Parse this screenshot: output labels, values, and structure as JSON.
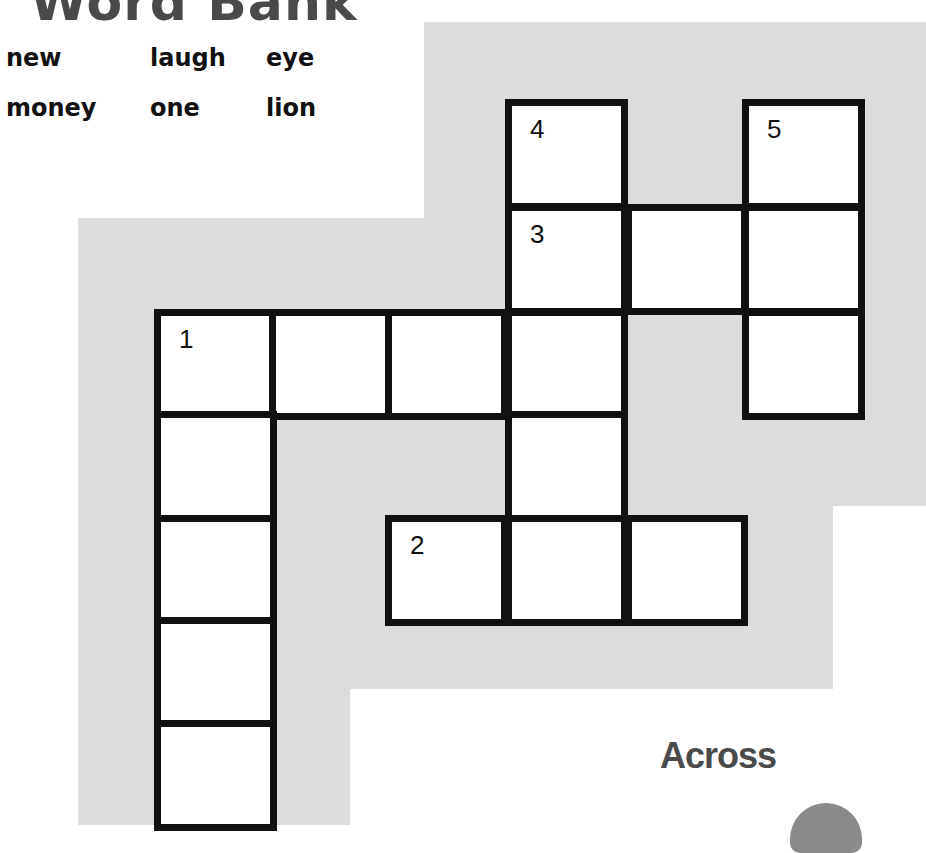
{
  "title": "Word Bank",
  "word_bank": {
    "rows": [
      [
        "new",
        "laugh",
        "eye"
      ],
      [
        "money",
        "one",
        "lion"
      ]
    ]
  },
  "crossword": {
    "cells": [
      {
        "col": 3,
        "row": 0,
        "number": "4"
      },
      {
        "col": 5,
        "row": 0,
        "number": "5"
      },
      {
        "col": 3,
        "row": 1,
        "number": "3"
      },
      {
        "col": 4,
        "row": 1,
        "number": ""
      },
      {
        "col": 5,
        "row": 1,
        "number": ""
      },
      {
        "col": 0,
        "row": 2,
        "number": "1"
      },
      {
        "col": 1,
        "row": 2,
        "number": ""
      },
      {
        "col": 2,
        "row": 2,
        "number": ""
      },
      {
        "col": 3,
        "row": 2,
        "number": ""
      },
      {
        "col": 5,
        "row": 2,
        "number": ""
      },
      {
        "col": 0,
        "row": 3,
        "number": ""
      },
      {
        "col": 3,
        "row": 3,
        "number": ""
      },
      {
        "col": 0,
        "row": 4,
        "number": ""
      },
      {
        "col": 2,
        "row": 4,
        "number": "2"
      },
      {
        "col": 3,
        "row": 4,
        "number": ""
      },
      {
        "col": 4,
        "row": 4,
        "number": ""
      },
      {
        "col": 0,
        "row": 5,
        "number": ""
      },
      {
        "col": 0,
        "row": 6,
        "number": ""
      }
    ]
  },
  "clues": {
    "across_heading": "Across"
  },
  "colors": {
    "background_gray": "#dcdcdc",
    "grid_line": "#111111",
    "heading": "#4a4a4a"
  }
}
